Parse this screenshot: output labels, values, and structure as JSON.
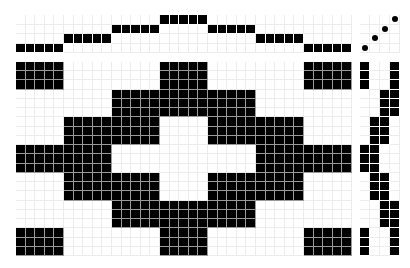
{
  "colors": {
    "ink": "#000000",
    "paper": "#ffffff",
    "grid_light": "#ececec",
    "grid_on_black": "#9a9a9a"
  },
  "draft": {
    "shafts": 4,
    "treadles": 4,
    "warp_ends": 35,
    "picks": 21,
    "threading": [
      1,
      1,
      1,
      1,
      1,
      2,
      2,
      2,
      2,
      2,
      3,
      3,
      3,
      3,
      3,
      4,
      4,
      4,
      4,
      4,
      3,
      3,
      3,
      3,
      3,
      2,
      2,
      2,
      2,
      2,
      1,
      1,
      1,
      1,
      1
    ],
    "tieup": [
      [
        1,
        1
      ],
      [
        2,
        2
      ],
      [
        3,
        3
      ],
      [
        4,
        4
      ]
    ],
    "treadling": [
      [
        1,
        4
      ],
      [
        1,
        4
      ],
      [
        1,
        4
      ],
      [
        3,
        4
      ],
      [
        3,
        4
      ],
      [
        3,
        4
      ],
      [
        2,
        3
      ],
      [
        2,
        3
      ],
      [
        2,
        3
      ],
      [
        1,
        2
      ],
      [
        1,
        2
      ],
      [
        1,
        2
      ],
      [
        2,
        3
      ],
      [
        2,
        3
      ],
      [
        2,
        3
      ],
      [
        3,
        4
      ],
      [
        3,
        4
      ],
      [
        3,
        4
      ],
      [
        1,
        4
      ],
      [
        1,
        4
      ],
      [
        1,
        4
      ]
    ]
  }
}
